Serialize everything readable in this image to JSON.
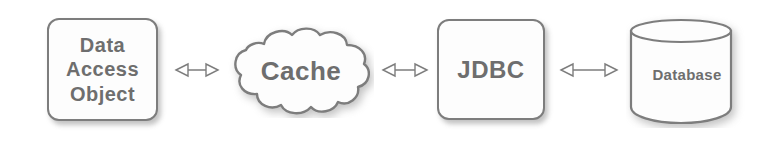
{
  "diagram": {
    "type": "flow-diagram",
    "background_color": "#ffffff",
    "stroke_color": "#7d7d7d",
    "text_color": "#6e6e6e",
    "fill_color": "#fdfdfd",
    "nodes": [
      {
        "id": "dao",
        "label": "Data\nAccess\nObject",
        "shape": "rounded-rectangle"
      },
      {
        "id": "cache",
        "label": "Cache",
        "shape": "cloud"
      },
      {
        "id": "jdbc",
        "label": "JDBC",
        "shape": "rounded-rectangle"
      },
      {
        "id": "database",
        "label": "Database",
        "shape": "cylinder"
      }
    ],
    "connectors": [
      {
        "id": "dao-cache",
        "from": "dao",
        "to": "cache",
        "style": "double-headed-hollow-arrow"
      },
      {
        "id": "cache-jdbc",
        "from": "cache",
        "to": "jdbc",
        "style": "double-headed-hollow-arrow"
      },
      {
        "id": "jdbc-database",
        "from": "jdbc",
        "to": "database",
        "style": "double-headed-hollow-arrow"
      }
    ]
  }
}
